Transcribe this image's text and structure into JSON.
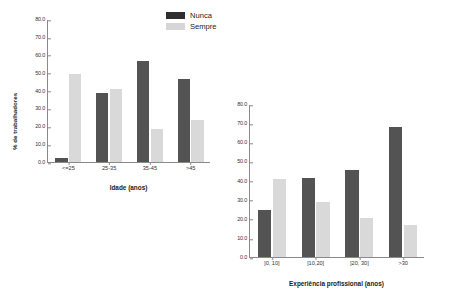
{
  "legend": {
    "position": "top-center",
    "entries": [
      {
        "label": "Nunca",
        "color": "#2e2e2e",
        "key": "nunca"
      },
      {
        "label": "Sempre",
        "color": "#d6d6d6",
        "key": "sempre"
      }
    ]
  },
  "colors": {
    "nunca": "#535353",
    "sempre": "#d9d9d9",
    "axis": "#8a8a8a",
    "text": "#1a1a1a",
    "background": "#ffffff"
  },
  "chart_data": [
    {
      "type": "bar",
      "id": "chart-idade",
      "title": "",
      "xlabel": "Idade (anos)",
      "ylabel": "% de trabalhadores",
      "categories": [
        "<=25",
        "25-35",
        "35-45",
        ">45"
      ],
      "series": [
        {
          "name": "Nunca",
          "values": [
            2.5,
            38.5,
            56.5,
            46.5
          ]
        },
        {
          "name": "Sempre",
          "values": [
            49.5,
            40.8,
            18.5,
            23.5
          ]
        }
      ],
      "ylim": [
        0,
        80
      ],
      "yticks": [
        "0.0",
        "10.0",
        "20.0",
        "30.0",
        "40.0",
        "50.0",
        "60.0",
        "70.0",
        "80.0"
      ],
      "ytick_values": [
        0,
        10,
        20,
        30,
        40,
        50,
        60,
        70,
        80
      ],
      "grid": false,
      "legend_position": "top-right"
    },
    {
      "type": "bar",
      "id": "chart-experiencia",
      "title": "",
      "xlabel": "Experiência profissional (anos)",
      "ylabel": "",
      "categories": [
        "]0, 10]",
        "]10,20]",
        "]20, 30]",
        ">30"
      ],
      "series": [
        {
          "name": "Nunca",
          "values": [
            24.5,
            41.5,
            45.5,
            68.0
          ]
        },
        {
          "name": "Sempre",
          "values": [
            41.0,
            29.0,
            20.5,
            16.5
          ]
        }
      ],
      "ylim": [
        0,
        80
      ],
      "yticks": [
        "0.0",
        "10.0",
        "20.0",
        "30.0",
        "40.0",
        "50.0",
        "60.0",
        "70.0",
        "80.0"
      ],
      "ytick_values": [
        0,
        10,
        20,
        30,
        40,
        50,
        60,
        70,
        80
      ],
      "grid": false,
      "legend_position": "none"
    }
  ]
}
